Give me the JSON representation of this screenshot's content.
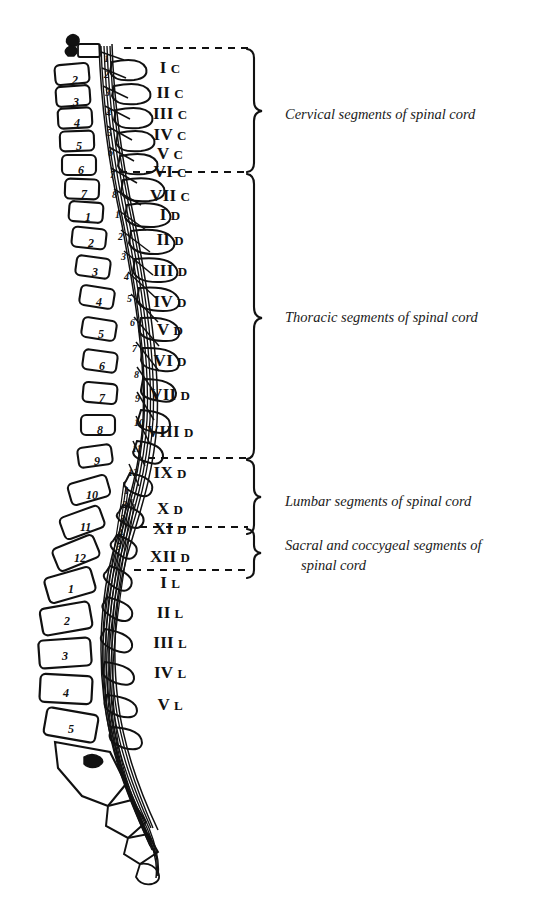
{
  "figure": {
    "ink_color": "#111111",
    "background_color": "#ffffff"
  },
  "regions": [
    {
      "id": "cervical",
      "caption": "Cervical segments of spinal cord",
      "caption_line2": "",
      "brace_top": 48,
      "brace_bottom": 172,
      "caption_y": 105
    },
    {
      "id": "thoracic",
      "caption": "Thoracic segments of spinal cord",
      "caption_line2": "",
      "brace_top": 172,
      "brace_bottom": 458,
      "caption_y": 308
    },
    {
      "id": "lumbar",
      "caption": "Lumbar segments of spinal cord",
      "caption_line2": "",
      "brace_top": 458,
      "brace_bottom": 527,
      "caption_y": 492
    },
    {
      "id": "sacral",
      "caption": "Sacral and coccygeal segments of",
      "caption_line2": "spinal cord",
      "brace_top": 527,
      "brace_bottom": 570,
      "caption_y": 536
    }
  ],
  "cord_segments": [
    {
      "roman": "I",
      "letter": "C",
      "y": 68
    },
    {
      "roman": "II",
      "letter": "C",
      "y": 93
    },
    {
      "roman": "III",
      "letter": "C",
      "y": 114
    },
    {
      "roman": "IV",
      "letter": "C",
      "y": 135
    },
    {
      "roman": "V",
      "letter": "C",
      "y": 154
    },
    {
      "roman": "VI",
      "letter": "C",
      "y": 172
    },
    {
      "roman": "VII",
      "letter": "C",
      "y": 196
    },
    {
      "roman": "I",
      "letter": "D",
      "y": 215
    },
    {
      "roman": "II",
      "letter": "D",
      "y": 240
    },
    {
      "roman": "III",
      "letter": "D",
      "y": 271
    },
    {
      "roman": "IV",
      "letter": "D",
      "y": 302
    },
    {
      "roman": "V",
      "letter": "D",
      "y": 330
    },
    {
      "roman": "VI",
      "letter": "D",
      "y": 361
    },
    {
      "roman": "VII",
      "letter": "D",
      "y": 395
    },
    {
      "roman": "VIII",
      "letter": "D",
      "y": 432
    },
    {
      "roman": "IX",
      "letter": "D",
      "y": 473
    },
    {
      "roman": "X",
      "letter": "D",
      "y": 509
    },
    {
      "roman": "XI",
      "letter": "D",
      "y": 529
    },
    {
      "roman": "XII",
      "letter": "D",
      "y": 557
    },
    {
      "roman": "I",
      "letter": "L",
      "y": 583
    },
    {
      "roman": "II",
      "letter": "L",
      "y": 613
    },
    {
      "roman": "III",
      "letter": "L",
      "y": 643
    },
    {
      "roman": "IV",
      "letter": "L",
      "y": 673
    },
    {
      "roman": "V",
      "letter": "L",
      "y": 705
    }
  ],
  "vertebral_bodies": [
    {
      "num": "2",
      "x": 72,
      "y": 74
    },
    {
      "num": "3",
      "x": 73,
      "y": 96
    },
    {
      "num": "4",
      "x": 74,
      "y": 117
    },
    {
      "num": "5",
      "x": 76,
      "y": 140
    },
    {
      "num": "6",
      "x": 78,
      "y": 164
    },
    {
      "num": "7",
      "x": 81,
      "y": 188
    },
    {
      "num": "1",
      "x": 85,
      "y": 211
    },
    {
      "num": "2",
      "x": 88,
      "y": 237
    },
    {
      "num": "3",
      "x": 92,
      "y": 266
    },
    {
      "num": "4",
      "x": 96,
      "y": 296
    },
    {
      "num": "5",
      "x": 98,
      "y": 328
    },
    {
      "num": "6",
      "x": 99,
      "y": 360
    },
    {
      "num": "7",
      "x": 99,
      "y": 392
    },
    {
      "num": "8",
      "x": 97,
      "y": 424
    },
    {
      "num": "9",
      "x": 94,
      "y": 455
    },
    {
      "num": "10",
      "x": 86,
      "y": 489
    },
    {
      "num": "11",
      "x": 80,
      "y": 521
    },
    {
      "num": "12",
      "x": 74,
      "y": 552
    },
    {
      "num": "1",
      "x": 68,
      "y": 583
    },
    {
      "num": "2",
      "x": 64,
      "y": 615
    },
    {
      "num": "3",
      "x": 62,
      "y": 650
    },
    {
      "num": "4",
      "x": 63,
      "y": 687
    },
    {
      "num": "5",
      "x": 68,
      "y": 723
    }
  ],
  "nerve_roots": [
    {
      "num": "1",
      "x": 104,
      "y": 54
    },
    {
      "num": "2",
      "x": 104,
      "y": 70
    },
    {
      "num": "3",
      "x": 105,
      "y": 88
    },
    {
      "num": "4",
      "x": 106,
      "y": 108
    },
    {
      "num": "5",
      "x": 107,
      "y": 128
    },
    {
      "num": "6",
      "x": 108,
      "y": 148
    },
    {
      "num": "7",
      "x": 110,
      "y": 170
    },
    {
      "num": "8",
      "x": 112,
      "y": 190
    },
    {
      "num": "1",
      "x": 115,
      "y": 210
    },
    {
      "num": "2",
      "x": 118,
      "y": 232
    },
    {
      "num": "3",
      "x": 121,
      "y": 252
    },
    {
      "num": "4",
      "x": 124,
      "y": 272
    },
    {
      "num": "5",
      "x": 127,
      "y": 294
    },
    {
      "num": "6",
      "x": 130,
      "y": 318
    },
    {
      "num": "7",
      "x": 132,
      "y": 344
    },
    {
      "num": "8",
      "x": 134,
      "y": 370
    },
    {
      "num": "9",
      "x": 135,
      "y": 394
    },
    {
      "num": "10",
      "x": 134,
      "y": 418
    },
    {
      "num": "11",
      "x": 132,
      "y": 444
    },
    {
      "num": "12",
      "x": 128,
      "y": 468
    },
    {
      "num": "1",
      "x": 124,
      "y": 486
    },
    {
      "num": "2",
      "x": 122,
      "y": 500
    },
    {
      "num": "3",
      "x": 120,
      "y": 514
    },
    {
      "num": "4",
      "x": 118,
      "y": 528
    },
    {
      "num": "5",
      "x": 116,
      "y": 542
    }
  ]
}
